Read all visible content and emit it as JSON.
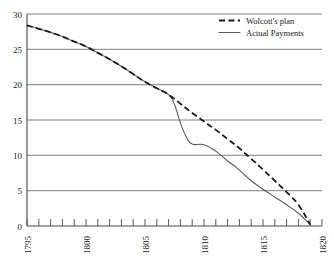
{
  "chart_data": {
    "type": "line",
    "title": "",
    "subtitle": "",
    "xlabel": "",
    "ylabel": "",
    "xlim": [
      1795,
      1820
    ],
    "ylim": [
      0,
      30
    ],
    "grid": "horizontal",
    "legend_position": "top-right",
    "y_ticks": [
      "0",
      "5",
      "10",
      "15",
      "20",
      "25",
      "30"
    ],
    "y_tick_values": [
      0,
      5,
      10,
      15,
      20,
      25,
      30
    ],
    "x_ticks": [
      "1795",
      "1800",
      "1805",
      "1810",
      "1815",
      "1820"
    ],
    "x_tick_values": [
      1795,
      1800,
      1805,
      1810,
      1815,
      1820
    ],
    "x_minor_tick_interval": 1,
    "series": [
      {
        "name": "Wolcott's plan",
        "style": "dashed",
        "color": "#1a1a1a",
        "x": [
          1795,
          1796,
          1797,
          1798,
          1799,
          1800,
          1801,
          1802,
          1803,
          1804,
          1805,
          1806,
          1807,
          1808,
          1809,
          1810,
          1811,
          1812,
          1813,
          1814,
          1815,
          1816,
          1817,
          1818,
          1819
        ],
        "values": [
          28.4,
          27.9,
          27.4,
          26.8,
          26.1,
          25.4,
          24.5,
          23.6,
          22.6,
          21.5,
          20.4,
          19.5,
          18.6,
          17.3,
          16.0,
          14.8,
          13.6,
          12.3,
          11.0,
          9.5,
          8.0,
          6.4,
          4.8,
          3.0,
          0.2
        ]
      },
      {
        "name": "Actual Payments",
        "style": "solid",
        "color": "#5a5a5a",
        "x": [
          1795,
          1796,
          1797,
          1798,
          1799,
          1800,
          1801,
          1802,
          1803,
          1804,
          1805,
          1806,
          1807,
          1807.5,
          1808,
          1808.5,
          1809,
          1810,
          1811,
          1812,
          1812.5,
          1813,
          1814,
          1815,
          1816,
          1817,
          1818,
          1819
        ],
        "values": [
          28.4,
          27.9,
          27.4,
          26.8,
          26.1,
          25.4,
          24.5,
          23.6,
          22.6,
          21.5,
          20.4,
          19.5,
          18.6,
          17.2,
          14.6,
          12.6,
          11.6,
          11.5,
          10.6,
          9.2,
          8.6,
          7.9,
          6.4,
          5.2,
          4.1,
          3.0,
          1.8,
          0.2
        ]
      }
    ]
  },
  "legend": {
    "entries": [
      {
        "label": "Wolcott's plan",
        "style": "dashed"
      },
      {
        "label": "Actual Payments",
        "style": "solid"
      }
    ]
  }
}
